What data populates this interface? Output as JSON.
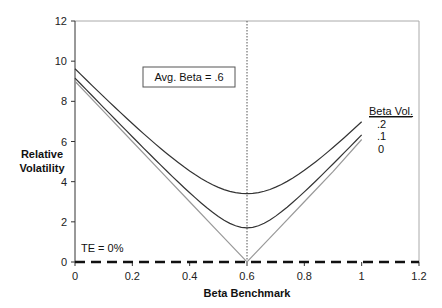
{
  "chart_data": {
    "type": "line",
    "title": "",
    "xlabel": "Beta Benchmark",
    "ylabel": "Relative Volatility",
    "xlim": [
      0,
      1.2
    ],
    "ylim": [
      0,
      12
    ],
    "x_ticks": [
      "0",
      "0.2",
      "0.4",
      "0.6",
      "0.8",
      "1",
      "1.2"
    ],
    "y_ticks": [
      "0",
      "2",
      "4",
      "6",
      "8",
      "10",
      "12"
    ],
    "grid": false,
    "legend": {
      "title": "Beta Vol.",
      "position": "right",
      "entries": [
        ".2",
        ".1",
        "0"
      ]
    },
    "x": [
      0,
      0.1,
      0.2,
      0.3,
      0.4,
      0.5,
      0.6,
      0.7,
      0.8,
      0.9,
      1.0
    ],
    "series": [
      {
        "name": ".2",
        "color": "#333333",
        "values": [
          9.6,
          8.3,
          7.1,
          5.9,
          4.8,
          3.9,
          3.4,
          3.9,
          4.8,
          5.9,
          7.0
        ]
      },
      {
        "name": ".1",
        "color": "#333333",
        "values": [
          9.1,
          7.7,
          6.3,
          5.0,
          3.7,
          2.4,
          1.7,
          2.4,
          3.7,
          5.0,
          6.3
        ]
      },
      {
        "name": "0",
        "color": "#999999",
        "values": [
          9.0,
          7.5,
          6.0,
          4.5,
          3.0,
          1.5,
          0.0,
          1.5,
          3.0,
          4.5,
          6.1
        ]
      },
      {
        "name": "TE = 0%",
        "color": "#111111",
        "style": "dashed",
        "x": [
          0,
          1.2
        ],
        "values": [
          0,
          0
        ]
      }
    ],
    "annotations": [
      {
        "text": "Avg. Beta = .6",
        "boxed": true
      },
      {
        "text": "TE = 0%"
      },
      {
        "text": "vertical dotted line at Beta Benchmark = 0.6"
      }
    ]
  },
  "labels": {
    "ylabel_line1": "Relative",
    "ylabel_line2": "Volatility",
    "xlabel": "Beta Benchmark",
    "avg_beta": "Avg. Beta = .6",
    "te": "TE = 0%",
    "legend_title": "Beta Vol.",
    "legend_entries": [
      ".2",
      ".1",
      "0"
    ]
  }
}
